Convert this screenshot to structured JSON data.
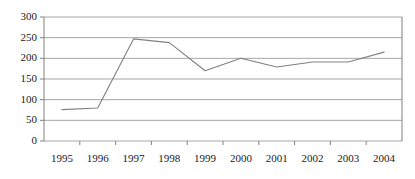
{
  "chart_data": {
    "type": "line",
    "title": "",
    "subtitle": "",
    "xlabel": "",
    "ylabel": "",
    "categories": [
      "1995",
      "1996",
      "1997",
      "1998",
      "1999",
      "2000",
      "2001",
      "2002",
      "2003",
      "2004"
    ],
    "x": [
      1995,
      1996,
      1997,
      1998,
      1999,
      2000,
      2001,
      2002,
      2003,
      2004
    ],
    "values": [
      76,
      80,
      247,
      238,
      170,
      200,
      179,
      191,
      191,
      215
    ],
    "series": [
      {
        "name": "",
        "values": [
          76,
          80,
          247,
          238,
          170,
          200,
          179,
          191,
          191,
          215
        ]
      }
    ],
    "ylim": [
      0,
      300
    ],
    "ytick_values": [
      0,
      50,
      100,
      150,
      200,
      250,
      300
    ],
    "ytick_labels": [
      "0",
      "50",
      "100",
      "150",
      "200",
      "250",
      "300"
    ],
    "xtick_labels": [
      "1995",
      "1996",
      "1997",
      "1998",
      "1999",
      "2000",
      "2001",
      "2002",
      "2003",
      "2004"
    ],
    "grid": true,
    "grid_axis": "y",
    "legend": false,
    "legend_position": "none",
    "annotations": [],
    "colors": {
      "line": "#808080",
      "grid": "#a6a6a6",
      "axis": "#808080",
      "text": "#1a1a1a",
      "background": "#ffffff"
    }
  }
}
